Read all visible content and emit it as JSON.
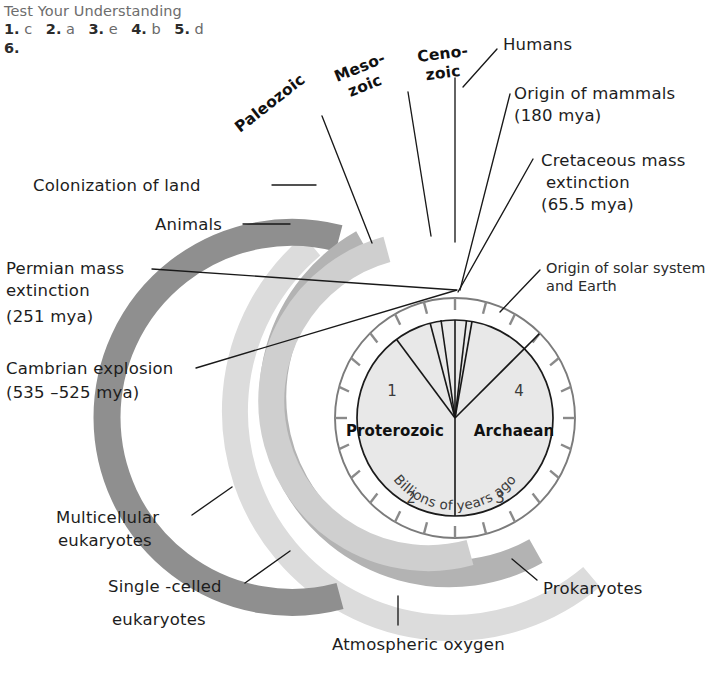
{
  "header": {
    "title": "Test Your Understanding",
    "answers": [
      {
        "number": "1.",
        "value": "c"
      },
      {
        "number": "2.",
        "value": "a"
      },
      {
        "number": "3.",
        "value": "e"
      },
      {
        "number": "4.",
        "value": "b"
      },
      {
        "number": "5.",
        "value": "d"
      }
    ],
    "next_question": "6."
  },
  "figure": {
    "kind": "clock-of-earth-history",
    "dial": {
      "center_label_left": "Proterozoic",
      "center_label_right": "Archaean",
      "units_caption": "Billions of years ago",
      "hour_numbers": [
        "1",
        "2",
        "3",
        "4"
      ]
    },
    "era_labels": [
      {
        "name": "era-label-paleozoic",
        "line1": "Paleozoic",
        "line2": ""
      },
      {
        "name": "era-label-mesozoic",
        "line1": "Meso-",
        "line2": "zoic"
      },
      {
        "name": "era-label-cenozoic",
        "line1": "Ceno-",
        "line2": "zoic"
      }
    ],
    "event_labels": [
      {
        "name": "label-humans",
        "lines": [
          "Humans"
        ],
        "style": "hand"
      },
      {
        "name": "label-origin-of-mammals",
        "lines": [
          "Origin of mammals",
          "(180 mya)"
        ],
        "style": "hand"
      },
      {
        "name": "label-cretaceous-mass-extinction",
        "lines": [
          "Cretaceous mass",
          "extinction",
          "(65.5 mya)"
        ],
        "style": "hand"
      },
      {
        "name": "label-origin-of-solar-system",
        "lines": [
          "Origin of solar system",
          "and Earth"
        ],
        "style": "printed"
      },
      {
        "name": "label-colonization-of-land",
        "lines": [
          "Colonization of land"
        ],
        "style": "hand"
      },
      {
        "name": "label-animals",
        "lines": [
          "Animals"
        ],
        "style": "hand"
      },
      {
        "name": "label-permian-mass-extinction",
        "lines": [
          "Permian mass",
          "extinction",
          "(251 mya)"
        ],
        "style": "hand"
      },
      {
        "name": "label-cambrian-explosion",
        "lines": [
          "Cambrian explosion",
          "(535 –525 mya)"
        ],
        "style": "hand"
      },
      {
        "name": "label-multicellular-eukaryotes",
        "lines": [
          "Multicellular",
          "eukaryotes"
        ],
        "style": "hand"
      },
      {
        "name": "label-single-celled-eukaryotes",
        "lines": [
          "Single -celled",
          "eukaryotes"
        ],
        "style": "hand"
      },
      {
        "name": "label-prokaryotes",
        "lines": [
          "Prokaryotes"
        ],
        "style": "hand"
      },
      {
        "name": "label-atmospheric-oxygen",
        "lines": [
          "Atmospheric oxygen"
        ],
        "style": "hand"
      }
    ],
    "band_colors": {
      "outer_light": "#dcdcdc",
      "dark": "#8f8f8f",
      "medium": "#b3b3b3",
      "inner_light": "#cfcfcf",
      "dial_face": "#e6e6e6",
      "ring_white": "#ffffff",
      "ring_stroke": "#7b7b7b",
      "tick": "#8a8a8a"
    }
  }
}
